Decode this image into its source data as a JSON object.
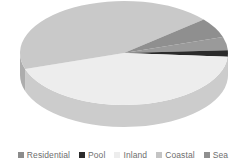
{
  "chart_data": {
    "type": "pie",
    "title": "",
    "subtitle": "",
    "xlabel": "",
    "ylabel": "",
    "grid": false,
    "three_d": true,
    "legend_position": "bottom",
    "categories": [
      "Residential",
      "Pool",
      "Inland",
      "Coastal",
      "Sea"
    ],
    "values": [
      4,
      2,
      44,
      44,
      6
    ],
    "percentages": [
      "4%",
      "2%",
      "44%",
      "44%",
      "6%"
    ],
    "colors": [
      "#9a9a9a",
      "#2b2b2b",
      "#ededed",
      "#c9c9c9",
      "#8f8f8f"
    ],
    "slices": [
      {
        "label": "Residential",
        "value": 4,
        "color": "#9a9a9a",
        "start_angle": 342,
        "end_angle": 357
      },
      {
        "label": "Pool",
        "value": 2,
        "color": "#2b2b2b",
        "start_angle": 357,
        "end_angle": 364
      },
      {
        "label": "Inland",
        "value": 44,
        "color": "#ededed",
        "start_angle": 364,
        "end_angle": 522
      },
      {
        "label": "Coastal",
        "value": 44,
        "color": "#c9c9c9",
        "start_angle": 522,
        "end_angle": 680
      },
      {
        "label": "Sea",
        "value": 6,
        "color": "#8f8f8f",
        "start_angle": 680,
        "end_angle": 702
      }
    ]
  },
  "legend": {
    "items": [
      {
        "label": "Residential",
        "swatch_color": "#8c8c8c",
        "icon": "square-swatch-icon"
      },
      {
        "label": "Pool",
        "swatch_color": "#2b2b2b",
        "icon": "square-swatch-icon"
      },
      {
        "label": "Inland",
        "swatch_color": "#ededed",
        "icon": "square-swatch-icon"
      },
      {
        "label": "Coastal",
        "swatch_color": "#c4c4c4",
        "icon": "square-swatch-icon"
      },
      {
        "label": "Sea",
        "swatch_color": "#8f8f8f",
        "icon": "square-swatch-icon"
      }
    ],
    "text_color": "#6e6e6e"
  },
  "geometry": {
    "center_x": 124,
    "center_y": 53,
    "radius_x": 104,
    "radius_y": 52,
    "depth": 22
  }
}
